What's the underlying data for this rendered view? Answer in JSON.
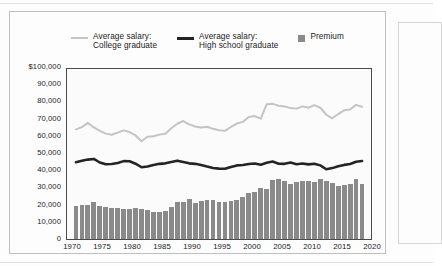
{
  "legend": {
    "items": [
      {
        "name": "college-graduate",
        "type": "line",
        "color": "#c4c4c4",
        "label": "Average salary:\nCollege graduate"
      },
      {
        "name": "high-school-graduate",
        "type": "line",
        "color": "#242424",
        "label": "Average salary:\nHigh school graduate"
      },
      {
        "name": "premium",
        "type": "swatch",
        "color": "#8a8a8a",
        "label": "Premium"
      }
    ]
  },
  "axes": {
    "y_ticks": [
      "$100,000",
      "90,000",
      "80,000",
      "70,000",
      "60,000",
      "50,000",
      "40,000",
      "30,000",
      "20,000",
      "10,000",
      "0"
    ],
    "x_ticks": [
      "1970",
      "1975",
      "1980",
      "1985",
      "1990",
      "1995",
      "2000",
      "2005",
      "2010",
      "2015",
      "2020"
    ]
  },
  "chart_data": {
    "type": "bar",
    "title": "",
    "subtitle": "",
    "xlabel": "",
    "ylabel": "",
    "xlim": [
      1969.0,
      2020.0
    ],
    "ylim": [
      0,
      100000
    ],
    "grid": false,
    "legend_position": "top-center",
    "y_tick_values": [
      0,
      10000,
      20000,
      30000,
      40000,
      50000,
      60000,
      70000,
      80000,
      90000,
      100000
    ],
    "x_tick_values": [
      1970,
      1975,
      1980,
      1985,
      1990,
      1995,
      2000,
      2005,
      2010,
      2015,
      2020
    ],
    "x": [
      1970,
      1971,
      1972,
      1973,
      1974,
      1975,
      1976,
      1977,
      1978,
      1979,
      1980,
      1981,
      1982,
      1983,
      1984,
      1985,
      1986,
      1987,
      1988,
      1989,
      1990,
      1991,
      1992,
      1993,
      1994,
      1995,
      1996,
      1997,
      1998,
      1999,
      2000,
      2001,
      2002,
      2003,
      2004,
      2005,
      2006,
      2007,
      2008,
      2009,
      2010,
      2011,
      2012,
      2013,
      2014,
      2015,
      2016,
      2017,
      2018
    ],
    "series": [
      {
        "name": "Premium",
        "type": "bar",
        "color": "#8a8a8a",
        "values": [
          19300,
          19800,
          20100,
          21700,
          19200,
          19100,
          18400,
          18100,
          17900,
          17800,
          18000,
          17900,
          17000,
          16000,
          16100,
          16300,
          18600,
          21800,
          21600,
          23400,
          21400,
          22300,
          22900,
          23200,
          21900,
          21700,
          22400,
          23000,
          24800,
          26800,
          27600,
          30200,
          29300,
          35000,
          35200,
          34000,
          32100,
          33400,
          34000,
          34300,
          33600,
          35500,
          34300,
          32700,
          31100,
          31900,
          32500,
          35200,
          32600
        ]
      },
      {
        "name": "Average salary: College graduate",
        "type": "line",
        "color": "#c4c4c4",
        "values": [
          64500,
          65800,
          68300,
          65600,
          63600,
          62000,
          61300,
          62600,
          63900,
          62900,
          60900,
          57500,
          60100,
          60400,
          61400,
          61900,
          65100,
          67800,
          69400,
          67400,
          66200,
          65600,
          66000,
          64800,
          64000,
          63600,
          65900,
          67900,
          68900,
          71800,
          72300,
          70800,
          79300,
          79500,
          78400,
          78000,
          77000,
          76700,
          78000,
          77200,
          78800,
          77200,
          73100,
          71000,
          73500,
          75700,
          76200,
          78900,
          77800
        ]
      },
      {
        "name": "Average salary: High school graduate",
        "type": "line",
        "color": "#242424",
        "values": [
          45200,
          46000,
          46700,
          47100,
          45000,
          44000,
          44100,
          44700,
          45800,
          45700,
          44300,
          42200,
          42600,
          43500,
          44200,
          44500,
          45300,
          46100,
          45300,
          44500,
          44200,
          43500,
          42600,
          41800,
          41400,
          41300,
          42400,
          43300,
          43500,
          44100,
          44400,
          43700,
          44900,
          45600,
          44300,
          44200,
          45000,
          44000,
          44400,
          43900,
          44300,
          43300,
          41000,
          41700,
          42800,
          43600,
          44100,
          45400,
          45900
        ]
      }
    ]
  }
}
